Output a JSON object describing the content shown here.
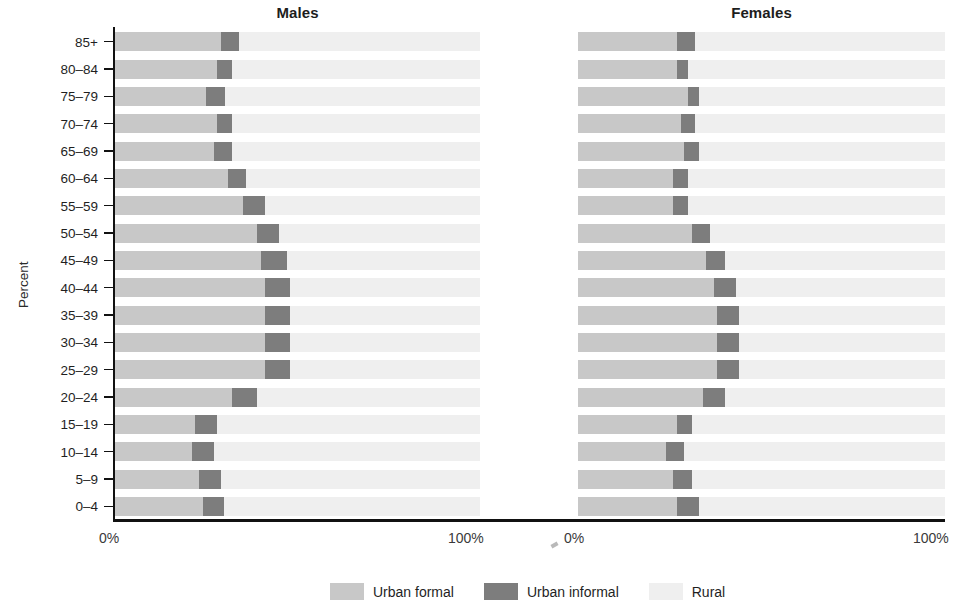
{
  "chart_data": {
    "type": "bar",
    "title": "",
    "subtitle": "",
    "orientation": "horizontal",
    "stacked": true,
    "normalized_percent": true,
    "xlabel": "",
    "ylabel": "Percent",
    "xlim": [
      0,
      100
    ],
    "xticks": [
      0,
      100
    ],
    "xtick_labels": [
      "0%",
      "100%"
    ],
    "grid": false,
    "legend_position": "bottom",
    "legend": [
      "Urban formal",
      "Urban informal",
      "Rural"
    ],
    "colors": {
      "urban_formal": "#c8c8c8",
      "urban_informal": "#7d7d7d",
      "rural": "#efefef",
      "axis": "#111111",
      "text": "#1f1f1f"
    },
    "panels": [
      {
        "name": "Males",
        "categories": [
          "85+",
          "80–84",
          "75–79",
          "70–74",
          "65–69",
          "60–64",
          "55–59",
          "50–54",
          "45–49",
          "40–44",
          "35–39",
          "30–34",
          "25–29",
          "20–24",
          "15–19",
          "10–14",
          "5–9",
          "0–4"
        ],
        "series": [
          {
            "name": "Urban formal",
            "values": [
              29,
              28,
              25,
              28,
              27,
              31,
              35,
              39,
              40,
              41,
              41,
              41,
              41,
              32,
              22,
              21,
              23,
              24
            ]
          },
          {
            "name": "Urban informal",
            "values": [
              5,
              4,
              5,
              4,
              5,
              5,
              6,
              6,
              7,
              7,
              7,
              7,
              7,
              7,
              6,
              6,
              6,
              6
            ]
          },
          {
            "name": "Rural",
            "values": [
              66,
              68,
              70,
              68,
              68,
              64,
              59,
              55,
              53,
              52,
              52,
              52,
              52,
              61,
              72,
              73,
              71,
              70
            ]
          }
        ]
      },
      {
        "name": "Females",
        "categories": [
          "85+",
          "80–84",
          "75–79",
          "70–74",
          "65–69",
          "60–64",
          "55–59",
          "50–54",
          "45–49",
          "40–44",
          "35–39",
          "30–34",
          "25–29",
          "20–24",
          "15–19",
          "10–14",
          "5–9",
          "0–4"
        ],
        "series": [
          {
            "name": "Urban formal",
            "values": [
              27,
              27,
              30,
              28,
              29,
              26,
              26,
              31,
              35,
              37,
              38,
              38,
              38,
              34,
              27,
              24,
              26,
              27
            ]
          },
          {
            "name": "Urban informal",
            "values": [
              5,
              3,
              3,
              4,
              4,
              4,
              4,
              5,
              5,
              6,
              6,
              6,
              6,
              6,
              4,
              5,
              5,
              6
            ]
          },
          {
            "name": "Rural",
            "values": [
              68,
              70,
              67,
              68,
              67,
              70,
              70,
              64,
              60,
              57,
              56,
              56,
              56,
              60,
              69,
              71,
              69,
              67
            ]
          }
        ]
      }
    ]
  },
  "panel_titles": {
    "males": "Males",
    "females": "Females"
  },
  "axis": {
    "ylabel": "Percent",
    "x_left_label": "0%",
    "x_right_label": "100%"
  },
  "legend": {
    "items": [
      {
        "label": "Urban formal",
        "color": "#c8c8c8",
        "swatch_name": "legend-swatch-urban-formal"
      },
      {
        "label": "Urban informal",
        "color": "#7d7d7d",
        "swatch_name": "legend-swatch-urban-informal"
      },
      {
        "label": "Rural",
        "color": "#efefef",
        "swatch_name": "legend-swatch-rural"
      }
    ]
  }
}
